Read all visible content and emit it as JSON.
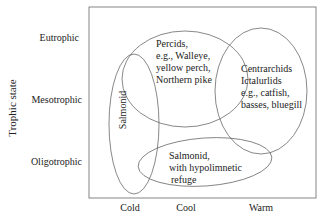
{
  "axes": {
    "y_title": "Trophic state",
    "y_levels": [
      "Eutrophic",
      "Mesotrophic",
      "Oligotrophic"
    ],
    "x_levels": [
      "Cold",
      "Cool",
      "Warm"
    ]
  },
  "groups": {
    "salmonid": {
      "label": "Salmonid"
    },
    "percids": {
      "lines": [
        "Percids,",
        "e.g., Walleye,",
        "yellow perch,",
        "Northern pike"
      ]
    },
    "centrarchids": {
      "lines": [
        "Centrarchids",
        "Ictalurlids",
        "e.g., catfish,",
        "basses, bluegill"
      ]
    },
    "salmonid_refuge": {
      "lines": [
        "Salmonid,",
        "with hypolimnetic",
        "refuge"
      ]
    }
  },
  "colors": {
    "line": "#555555",
    "frame": "#666666",
    "text": "#222222"
  }
}
